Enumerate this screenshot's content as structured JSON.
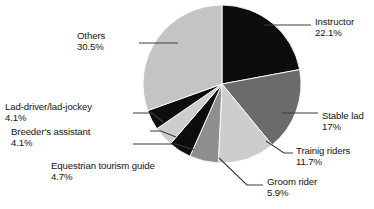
{
  "chart_data": {
    "type": "pie",
    "title": "",
    "subtitle": "",
    "xlabel": "",
    "ylabel": "",
    "legend_position": "none",
    "grid": false,
    "unit": "%",
    "categories": [
      "Instructor",
      "Stable lad",
      "Trainig riders",
      "Groom rider",
      "Equestrian tourism guide",
      "Breeder's assistant",
      "Lad-driver/lad-jockey",
      "Others"
    ],
    "values": [
      22.1,
      17,
      11.7,
      5.9,
      4.7,
      4.1,
      4.1,
      30.5
    ],
    "value_labels": [
      "22.1%",
      "17%",
      "11.7%",
      "5.9%",
      "4.7%",
      "4.1%",
      "4.1%",
      "30.5%"
    ],
    "colors": [
      "#0d0d0d",
      "#6b6b6b",
      "#cdcdcd",
      "#8e8e8e",
      "#0d0d0d",
      "#cdcdcd",
      "#0d0d0d",
      "#c4c4c4"
    ],
    "slices": [
      {
        "label": "Instructor",
        "value": 22.1,
        "value_label": "22.1%",
        "color": "#0d0d0d"
      },
      {
        "label": "Stable lad",
        "value": 17,
        "value_label": "17%",
        "color": "#6b6b6b"
      },
      {
        "label": "Trainig riders",
        "value": 11.7,
        "value_label": "11.7%",
        "color": "#cdcdcd"
      },
      {
        "label": "Groom rider",
        "value": 5.9,
        "value_label": "5.9%",
        "color": "#8e8e8e"
      },
      {
        "label": "Equestrian tourism guide",
        "value": 4.7,
        "value_label": "4.7%",
        "color": "#0d0d0d"
      },
      {
        "label": "Breeder's assistant",
        "value": 4.1,
        "value_label": "4.1%",
        "color": "#cdcdcd"
      },
      {
        "label": "Lad-driver/lad-jockey",
        "value": 4.1,
        "value_label": "4.1%",
        "color": "#0d0d0d"
      },
      {
        "label": "Others",
        "value": 30.5,
        "value_label": "30.5%",
        "color": "#c4c4c4"
      }
    ]
  },
  "labels": {
    "instructor": {
      "name": "Instructor",
      "percent": "22.1%"
    },
    "stable_lad": {
      "name": "Stable lad",
      "percent": "17%"
    },
    "training": {
      "name": "Trainig riders",
      "percent": "11.7%"
    },
    "groom": {
      "name": "Groom rider",
      "percent": "5.9%"
    },
    "equestrian": {
      "name": "Equestrian tourism guide",
      "percent": "4.7%"
    },
    "breeders": {
      "name": "Breeder's assistant",
      "percent": "4.1%"
    },
    "lad_driver": {
      "name": "Lad-driver/lad-jockey",
      "percent": "4.1%"
    },
    "others": {
      "name": "Others",
      "percent": "30.5%"
    }
  },
  "style": {
    "background": "#ffffff",
    "text_color": "#141414",
    "leader_color": "#3c3c3c"
  }
}
